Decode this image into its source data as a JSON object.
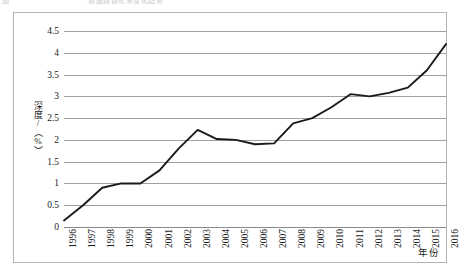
{
  "page": {
    "top_cut_text_left": "图",
    "top_cut_text_right": "我国城镇化率变化趋势"
  },
  "axes": {
    "y_title": "深度/（%）",
    "x_title": "年份"
  },
  "chart_data": {
    "type": "line",
    "title": "",
    "subtitle": "",
    "xlabel": "年份",
    "ylabel": "深度/（%）",
    "grid": true,
    "legend": false,
    "legend_position": "none",
    "line_color": "#1a1a1a",
    "gridline_color": "#a0a0a0",
    "ylim": [
      0,
      4.5
    ],
    "yticks": [
      0,
      0.5,
      1,
      1.5,
      2,
      2.5,
      3,
      3.5,
      4,
      4.5
    ],
    "ytick_labels": [
      "0",
      "0.5",
      "1",
      "1.5",
      "2",
      "2.5",
      "3",
      "3.5",
      "4",
      "4.5"
    ],
    "categories": [
      "1996",
      "1997",
      "1998",
      "1999",
      "2000",
      "2001",
      "2002",
      "2003",
      "2004",
      "2005",
      "2006",
      "2007",
      "2008",
      "2009",
      "2010",
      "2011",
      "2012",
      "2013",
      "2014",
      "2015",
      "2016"
    ],
    "values": [
      0.15,
      0.5,
      0.9,
      1.0,
      1.0,
      1.3,
      1.8,
      2.23,
      2.02,
      2.0,
      1.9,
      1.92,
      2.38,
      2.5,
      2.75,
      3.05,
      3.0,
      3.08,
      3.2,
      3.6,
      4.2
    ],
    "series": [
      {
        "name": "深度",
        "values": [
          0.15,
          0.5,
          0.9,
          1.0,
          1.0,
          1.3,
          1.8,
          2.23,
          2.02,
          2.0,
          1.9,
          1.92,
          2.38,
          2.5,
          2.75,
          3.05,
          3.0,
          3.08,
          3.2,
          3.6,
          4.2
        ]
      }
    ]
  }
}
